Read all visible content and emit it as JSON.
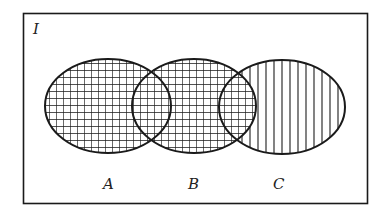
{
  "diagram": {
    "type": "venn",
    "universe_label": "I",
    "sets": [
      {
        "id": "A",
        "label": "A",
        "fill": "grid"
      },
      {
        "id": "B",
        "label": "B",
        "fill": "grid"
      },
      {
        "id": "C",
        "label": "C",
        "fill": "vertical-lines"
      }
    ],
    "overlaps": [
      {
        "sets": [
          "A",
          "B"
        ],
        "fill": "grid"
      },
      {
        "sets": [
          "B",
          "C"
        ],
        "fill": "grid"
      }
    ],
    "colors": {
      "stroke": "#1a1a1a",
      "background": "#ffffff"
    }
  }
}
